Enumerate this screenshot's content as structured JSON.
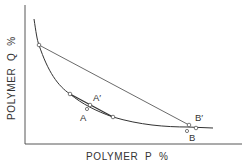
{
  "diagram": {
    "type": "phase-diagram",
    "x_axis": {
      "label": "POLYMER  P  %"
    },
    "y_axis": {
      "label": "POLYMER  Q  %"
    },
    "points": [
      {
        "id": "A",
        "label": "A"
      },
      {
        "id": "A_prime",
        "label": "A′"
      },
      {
        "id": "B",
        "label": "B"
      },
      {
        "id": "B_prime",
        "label": "B′"
      }
    ],
    "elements": {
      "binodal_curve": "two-phase boundary curve",
      "tie_line_long": "tie line through B",
      "tie_line_short": "tie line through A"
    },
    "colors": {
      "line": "#333333",
      "background": "#ffffff",
      "marker_fill": "#ffffff"
    }
  }
}
